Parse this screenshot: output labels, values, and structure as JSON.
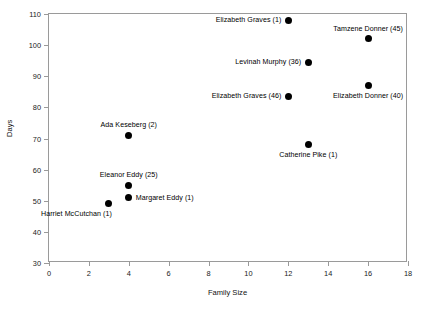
{
  "chart_data": {
    "type": "scatter",
    "title": "",
    "xlabel": "Family Size",
    "ylabel": "Days",
    "xlim": [
      0,
      18
    ],
    "ylim": [
      30,
      110
    ],
    "xticks": [
      0,
      2,
      4,
      6,
      8,
      10,
      12,
      14,
      16,
      18
    ],
    "yticks": [
      30,
      40,
      50,
      60,
      70,
      80,
      90,
      100,
      110
    ],
    "grid": false,
    "legend": "none",
    "marker": {
      "shape": "circle",
      "color": "#000000",
      "size": 7
    },
    "points": [
      {
        "label": "Elizabeth Graves (1)",
        "x": 12,
        "y": 108,
        "label_pos": "left"
      },
      {
        "label": "Tamzene Donner (45)",
        "x": 16,
        "y": 102,
        "label_pos": "above"
      },
      {
        "label": "Levinah Murphy (36)",
        "x": 13,
        "y": 94.5,
        "label_pos": "left"
      },
      {
        "label": "Elizabeth Donner (40)",
        "x": 16,
        "y": 87,
        "label_pos": "below"
      },
      {
        "label": "Elizabeth Graves (46)",
        "x": 12,
        "y": 83.5,
        "label_pos": "left"
      },
      {
        "label": "Ada Keseberg (2)",
        "x": 4,
        "y": 71,
        "label_pos": "above"
      },
      {
        "label": "Catherine Pike (1)",
        "x": 13,
        "y": 68,
        "label_pos": "below"
      },
      {
        "label": "Eleanor Eddy (25)",
        "x": 4,
        "y": 55,
        "label_pos": "above"
      },
      {
        "label": "Margaret Eddy (1)",
        "x": 4,
        "y": 51,
        "label_pos": "right"
      },
      {
        "label": "Harriet McCutchan (1)",
        "x": 3,
        "y": 49,
        "label_pos": "belowleft"
      }
    ]
  },
  "colors": {
    "marker": "#000000",
    "frame": "#9a9a9a",
    "text": "#000000",
    "background": "#ffffff"
  }
}
